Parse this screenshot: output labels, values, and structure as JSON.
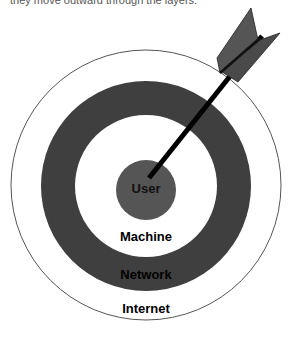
{
  "caption": "they move outward through the layers.",
  "target": {
    "center": [
      146,
      185
    ],
    "rings": [
      {
        "name": "Internet",
        "radius": 135,
        "fill": "#ffffff",
        "stroke": "#555555"
      },
      {
        "name": "Network",
        "radius": 105,
        "fill": "#3f3f3f"
      },
      {
        "name": "Machine",
        "radius": 71,
        "fill": "#ffffff"
      },
      {
        "name": "User",
        "radius": 30,
        "fill": "#555555"
      }
    ]
  },
  "labels": {
    "user": "User",
    "machine": "Machine",
    "network": "Network",
    "internet": "Internet"
  },
  "arrow": {
    "shaft_color": "#000000",
    "fletching_color": "#555555"
  }
}
